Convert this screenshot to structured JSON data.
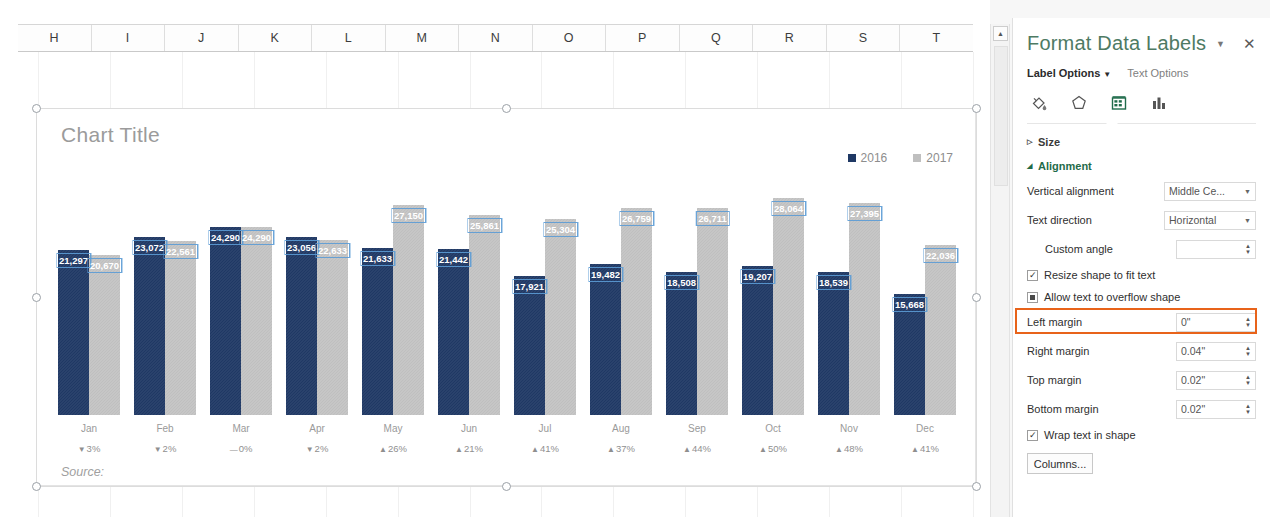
{
  "spreadsheet": {
    "columns": [
      "H",
      "I",
      "J",
      "K",
      "L",
      "M",
      "N",
      "O",
      "P",
      "Q",
      "R",
      "S",
      "T"
    ]
  },
  "chart": {
    "title": "Chart Title",
    "source_note": "Source:"
  },
  "scrollbar": {
    "up_arrow": "▲"
  },
  "pane": {
    "title": "Format Data Labels",
    "menu_arrow": "▼",
    "close": "✕",
    "tabs": [
      {
        "label": "Label Options",
        "caret": "▼",
        "active": true
      },
      {
        "label": "Text Options",
        "caret": "",
        "active": false
      }
    ],
    "icons": [
      {
        "name": "fill-and-line-icon",
        "selected": false
      },
      {
        "name": "effects-icon",
        "selected": false
      },
      {
        "name": "size-and-properties-icon",
        "selected": true
      },
      {
        "name": "label-options-icon",
        "selected": false
      }
    ],
    "sections": {
      "size": {
        "label": "Size",
        "triangle": "▷",
        "expanded": false
      },
      "alignment": {
        "label": "Alignment",
        "triangle": "◢",
        "expanded": true
      }
    },
    "fields": [
      {
        "label": "Vertical alignment",
        "value": "Middle Ce...",
        "type": "select",
        "caret": "▼"
      },
      {
        "label": "Text direction",
        "value": "Horizontal",
        "type": "select",
        "caret": "▼"
      },
      {
        "label": "Custom angle",
        "value": "",
        "type": "spin"
      },
      {
        "label": "Left margin",
        "value": "0\"",
        "type": "spin",
        "highlighted": true
      },
      {
        "label": "Right margin",
        "value": "0.04\"",
        "type": "spin"
      },
      {
        "label": "Top margin",
        "value": "0.02\"",
        "type": "spin"
      },
      {
        "label": "Bottom margin",
        "value": "0.02\"",
        "type": "spin"
      }
    ],
    "checkboxes": [
      {
        "label": "Resize shape to fit text",
        "state": "checked",
        "mark": "✓"
      },
      {
        "label": "Allow text to overflow shape",
        "state": "mixed",
        "mark": ""
      },
      {
        "label": "Wrap text in shape",
        "state": "checked",
        "mark": "✓"
      }
    ],
    "columns_button": "Columns...",
    "accent_color": "#1f6b4a",
    "highlight_color": "#e8631a"
  },
  "chart_data": {
    "type": "bar",
    "title": "Chart Title",
    "xlabel": "",
    "ylabel": "",
    "ylim": [
      0,
      30000
    ],
    "grid": false,
    "legend_position": "top-right",
    "categories": [
      "Jan",
      "Feb",
      "Mar",
      "Apr",
      "May",
      "Jun",
      "Jul",
      "Aug",
      "Sep",
      "Oct",
      "Nov",
      "Dec"
    ],
    "series": [
      {
        "name": "2016",
        "color": "#1f3864",
        "values": [
          21297,
          23072,
          24290,
          23056,
          21633,
          21442,
          17921,
          19482,
          18508,
          19207,
          18539,
          15668
        ],
        "labels": [
          "21,297",
          "23,072",
          "24,290",
          "23,056",
          "21,633",
          "21,442",
          "17,921",
          "19,482",
          "18,508",
          "19,207",
          "18,539",
          "15,668"
        ]
      },
      {
        "name": "2017",
        "color": "#bfbfbf",
        "values": [
          20670,
          22561,
          24290,
          22633,
          27150,
          25861,
          25304,
          26759,
          26711,
          28064,
          27395,
          22036
        ],
        "labels": [
          "20,670",
          "22,561",
          "24,290",
          "22,633",
          "27,150",
          "25,861",
          "25,304",
          "26,759",
          "26,711",
          "28,064",
          "27,395",
          "22,036"
        ]
      }
    ],
    "annotations": {
      "name": "percent-change",
      "values": [
        {
          "arrow": "▼",
          "text": "3%"
        },
        {
          "arrow": "▼",
          "text": "2%"
        },
        {
          "arrow": "—",
          "text": "0%"
        },
        {
          "arrow": "▼",
          "text": "2%"
        },
        {
          "arrow": "▲",
          "text": "26%"
        },
        {
          "arrow": "▲",
          "text": "21%"
        },
        {
          "arrow": "▲",
          "text": "41%"
        },
        {
          "arrow": "▲",
          "text": "37%"
        },
        {
          "arrow": "▲",
          "text": "44%"
        },
        {
          "arrow": "▲",
          "text": "50%"
        },
        {
          "arrow": "▲",
          "text": "48%"
        },
        {
          "arrow": "▲",
          "text": "41%"
        }
      ]
    }
  }
}
